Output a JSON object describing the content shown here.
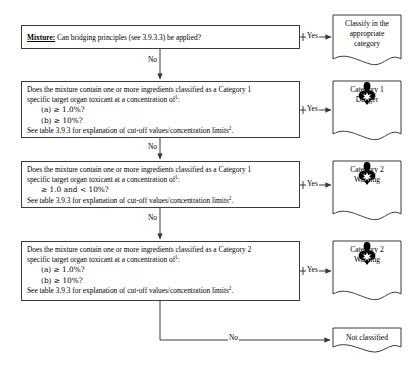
{
  "decisions": [
    {
      "id": "bridging",
      "lead_label": "Mixture:",
      "question": "Can bridging principles (see 3.9.3.3) be applied?",
      "yes_label": "Yes",
      "no_label": "No"
    },
    {
      "id": "category1-ab",
      "line1": "Does the mixture contain one or more ingredients classified as a Category 1",
      "line2": "specific target organ toxicant at a concentration of",
      "line2_sup": "1",
      "line2_tail": ":",
      "option_a": "(a)   ≥  1.0%?",
      "option_b": "(b)   ≥  10%?",
      "footer": "See table 3.9.3 for explanation of cut-off values/concentration limits",
      "footer_sup": "2",
      "footer_tail": ".",
      "yes_label": "Yes",
      "no_label": "No"
    },
    {
      "id": "category1-range",
      "line1": "Does the mixture contain one or more ingredients classified as a Category 1",
      "line2": "specific target organ toxicant at a concentration of",
      "line2_sup": "1",
      "line2_tail": ":",
      "option_a": "≥  1.0 and < 10%?",
      "footer": "See table 3.9.3 for explanation of cut-off values/concentration limits",
      "footer_sup": "2",
      "footer_tail": ".",
      "yes_label": "Yes",
      "no_label": "No"
    },
    {
      "id": "category2-ab",
      "line1": "Does the mixture contain one or more ingredients classified as a Category 2",
      "line2": "specific target organ toxicant at a concentration of",
      "line2_sup": "1",
      "line2_tail": ":",
      "option_a": "(a)  ≥ 1.0%?",
      "option_b": "(b)  ≥ 10%?",
      "footer": "See table 3.9.3 for explanation of cut-off values/concentration limits",
      "footer_sup": "2",
      "footer_tail": ".",
      "yes_label": "Yes",
      "no_label": "No"
    }
  ],
  "outcomes": [
    {
      "id": "classify-appropriate",
      "line1": "Classify in the",
      "line2": "appropriate",
      "line3": "category",
      "pictogram": null,
      "signal_word": null
    },
    {
      "id": "category-1-danger",
      "line1": "Category 1",
      "pictogram": "ghs-health-hazard-icon",
      "signal_word": "Danger"
    },
    {
      "id": "category-2-warning-upper",
      "line1": "Category 2",
      "pictogram": "ghs-health-hazard-icon",
      "signal_word": "Warning"
    },
    {
      "id": "category-2-warning-lower",
      "line1": "Category 2",
      "pictogram": "ghs-health-hazard-icon",
      "signal_word": "Warning"
    },
    {
      "id": "not-classified",
      "line1": "Not classified",
      "pictogram": null,
      "signal_word": null
    }
  ],
  "connectors": {
    "final_no_label": "No"
  },
  "colors": {
    "stroke": "#3a3a3a",
    "text": "#000000",
    "background": "#ffffff",
    "pictogram": "#000000"
  }
}
